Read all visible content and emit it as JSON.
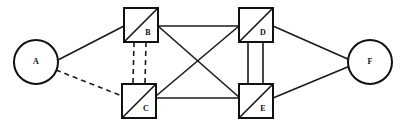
{
  "diagram": {
    "canvas": {
      "width": 403,
      "height": 126
    },
    "colors": {
      "background": "#ffffff",
      "stroke": "#111111",
      "edge": "#1a1a1a"
    },
    "nodes": [
      {
        "id": "A",
        "label": "A",
        "shape": "circle",
        "cx": 36,
        "cy": 62,
        "r": 22,
        "label_x": 36,
        "label_y": 62
      },
      {
        "id": "B",
        "label": "B",
        "shape": "square-diagonal",
        "x": 124,
        "y": 8,
        "w": 34,
        "h": 34,
        "label_x": 148,
        "label_y": 33
      },
      {
        "id": "C",
        "label": "C",
        "shape": "square-diagonal",
        "x": 122,
        "y": 84,
        "w": 34,
        "h": 34,
        "label_x": 146,
        "label_y": 109
      },
      {
        "id": "D",
        "label": "D",
        "shape": "square-diagonal",
        "x": 239,
        "y": 8,
        "w": 34,
        "h": 34,
        "label_x": 263,
        "label_y": 33
      },
      {
        "id": "E",
        "label": "E",
        "shape": "square-diagonal",
        "x": 239,
        "y": 84,
        "w": 34,
        "h": 34,
        "label_x": 263,
        "label_y": 109
      },
      {
        "id": "F",
        "label": "F",
        "shape": "circle",
        "cx": 370,
        "cy": 62,
        "r": 22,
        "label_x": 370,
        "label_y": 62
      }
    ],
    "edges": [
      {
        "id": "A-B",
        "from": "A",
        "to": "B",
        "style": "solid",
        "x1": 56,
        "y1": 61,
        "x2": 124,
        "y2": 26
      },
      {
        "id": "A-C",
        "from": "A",
        "to": "C",
        "style": "dashed",
        "x1": 56,
        "y1": 70,
        "x2": 122,
        "y2": 96
      },
      {
        "id": "B-C-left",
        "from": "B",
        "to": "C",
        "style": "dashed",
        "x1": 134,
        "y1": 42,
        "x2": 133,
        "y2": 84
      },
      {
        "id": "B-C-right",
        "from": "B",
        "to": "C",
        "style": "dashed",
        "x1": 146,
        "y1": 42,
        "x2": 145,
        "y2": 84
      },
      {
        "id": "B-D",
        "from": "B",
        "to": "D",
        "style": "solid",
        "x1": 158,
        "y1": 26,
        "x2": 239,
        "y2": 26
      },
      {
        "id": "B-E",
        "from": "B",
        "to": "E",
        "style": "solid",
        "x1": 158,
        "y1": 26,
        "x2": 240,
        "y2": 98
      },
      {
        "id": "C-D",
        "from": "C",
        "to": "D",
        "style": "solid",
        "x1": 156,
        "y1": 96,
        "x2": 239,
        "y2": 26
      },
      {
        "id": "C-E",
        "from": "C",
        "to": "E",
        "style": "solid",
        "x1": 156,
        "y1": 98,
        "x2": 239,
        "y2": 98
      },
      {
        "id": "D-E-left",
        "from": "D",
        "to": "E",
        "style": "solid",
        "x1": 248,
        "y1": 42,
        "x2": 248,
        "y2": 84
      },
      {
        "id": "D-E-right",
        "from": "D",
        "to": "E",
        "style": "solid",
        "x1": 263,
        "y1": 42,
        "x2": 263,
        "y2": 84
      },
      {
        "id": "D-F",
        "from": "D",
        "to": "F",
        "style": "solid",
        "x1": 273,
        "y1": 26,
        "x2": 350,
        "y2": 60
      },
      {
        "id": "E-F",
        "from": "E",
        "to": "F",
        "style": "solid",
        "x1": 273,
        "y1": 98,
        "x2": 350,
        "y2": 66
      }
    ]
  }
}
